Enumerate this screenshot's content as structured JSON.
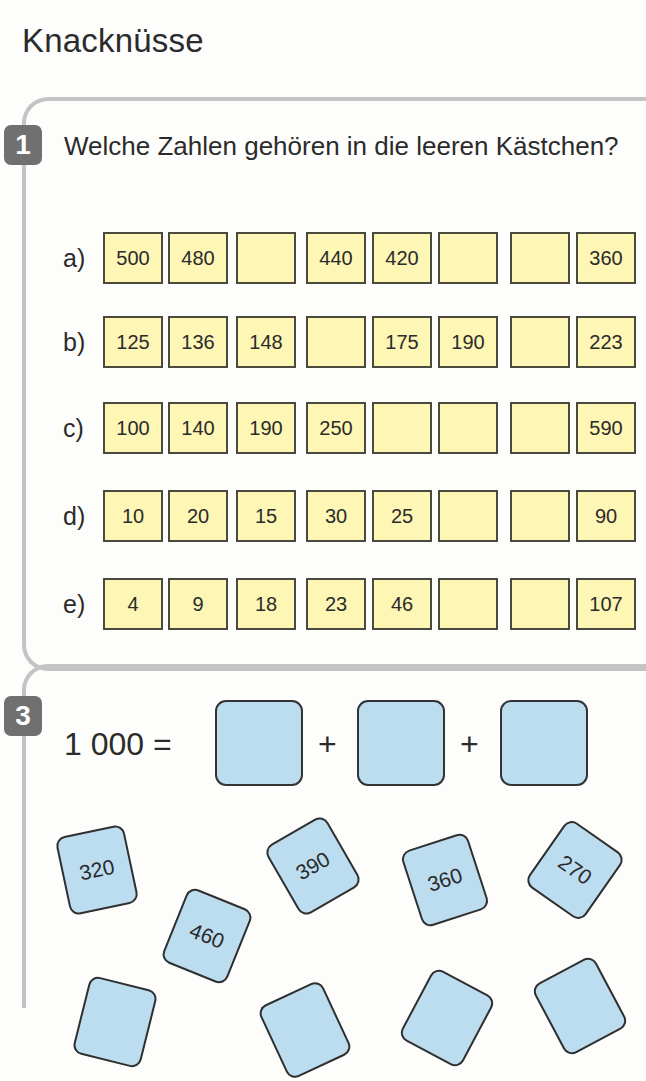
{
  "page": {
    "title": "Knacknüsse"
  },
  "exercise1": {
    "number": "1",
    "question": "Welche Zahlen gehören in die leeren Kästchen?",
    "rows": [
      {
        "label": "a)",
        "cells": [
          "500",
          "480",
          "",
          "440",
          "420",
          "",
          "",
          "360"
        ]
      },
      {
        "label": "b)",
        "cells": [
          "125",
          "136",
          "148",
          "",
          "175",
          "190",
          "",
          "223"
        ]
      },
      {
        "label": "c)",
        "cells": [
          "100",
          "140",
          "190",
          "250",
          "",
          "",
          "",
          "590"
        ]
      },
      {
        "label": "d)",
        "cells": [
          "10",
          "20",
          "15",
          "30",
          "25",
          "",
          "",
          "90"
        ]
      },
      {
        "label": "e)",
        "cells": [
          "4",
          "9",
          "18",
          "23",
          "46",
          "",
          "",
          "107"
        ]
      }
    ]
  },
  "exercise3": {
    "number": "3",
    "equation_lhs": "1 000 =",
    "plus_1": "+",
    "plus_2": "+",
    "answer_boxes": [
      "",
      "",
      ""
    ],
    "cards": [
      {
        "value": "320"
      },
      {
        "value": "460"
      },
      {
        "value": "390"
      },
      {
        "value": "360"
      },
      {
        "value": "270"
      },
      {
        "value": ""
      },
      {
        "value": ""
      },
      {
        "value": ""
      },
      {
        "value": ""
      }
    ]
  },
  "colors": {
    "cell_fill": "#fdf6b5",
    "card_fill": "#bcdcef",
    "badge_fill": "#707070",
    "frame_line": "#c4c4c4"
  }
}
